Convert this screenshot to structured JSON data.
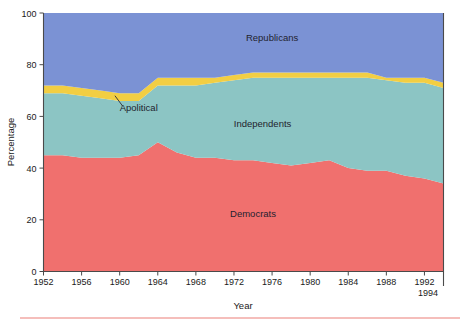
{
  "figure": {
    "background": "#ffffff",
    "bottom_rule_color": "#F2A9A4"
  },
  "axes": {
    "x_title": "Year",
    "y_title": "Percentage",
    "x_tick_labels": [
      "1952",
      "1956",
      "1960",
      "1964",
      "1968",
      "1972",
      "1976",
      "1980",
      "1984",
      "1988",
      "1992"
    ],
    "x_end_label": "1994",
    "y_tick_labels": [
      "0",
      "20",
      "40",
      "60",
      "80",
      "100"
    ]
  },
  "series_labels": {
    "republicans": "Republicans",
    "apolitical": "Apolitical",
    "independents": "Independents",
    "democrats": "Democrats"
  },
  "colors": {
    "democrats": "#F0706E",
    "independents": "#8CC5C4",
    "apolitical": "#F2CE43",
    "republicans": "#7B92D4",
    "axis": "#4a4a4a",
    "text": "#1a1a1a"
  },
  "chart_data": {
    "type": "area",
    "title": "",
    "xlabel": "Year",
    "ylabel": "Percentage",
    "xlim": [
      1952,
      1994
    ],
    "ylim": [
      0,
      100
    ],
    "grid": false,
    "stacked": true,
    "legend": "inline-labels",
    "x": [
      1952,
      1954,
      1956,
      1958,
      1960,
      1962,
      1964,
      1966,
      1968,
      1970,
      1972,
      1974,
      1976,
      1978,
      1980,
      1982,
      1984,
      1986,
      1988,
      1990,
      1992,
      1994
    ],
    "series": [
      {
        "name": "Democrats",
        "color": "#F0706E",
        "values": [
          45,
          45,
          44,
          44,
          44,
          45,
          50,
          46,
          44,
          44,
          43,
          43,
          42,
          41,
          42,
          43,
          40,
          39,
          39,
          37,
          36,
          34
        ]
      },
      {
        "name": "Independents",
        "color": "#8CC5C4",
        "values": [
          24,
          24,
          24,
          23,
          22,
          21,
          22,
          26,
          28,
          29,
          31,
          32,
          33,
          34,
          33,
          32,
          35,
          36,
          35,
          36,
          37,
          37
        ]
      },
      {
        "name": "Apolitical",
        "color": "#F2CE43",
        "values": [
          3,
          3,
          3,
          3,
          3,
          3,
          3,
          3,
          3,
          2,
          2,
          2,
          2,
          2,
          2,
          2,
          2,
          2,
          1,
          2,
          2,
          2
        ]
      },
      {
        "name": "Republicans",
        "color": "#7B92D4",
        "values": [
          28,
          28,
          29,
          30,
          31,
          31,
          25,
          25,
          25,
          25,
          24,
          23,
          23,
          23,
          23,
          23,
          23,
          23,
          25,
          25,
          25,
          27
        ]
      }
    ],
    "annotations": [
      {
        "text": "Republicans",
        "x": 1976,
        "y": 89
      },
      {
        "text": "Independents",
        "x": 1975,
        "y": 56
      },
      {
        "text": "Apolitical",
        "x": 1962,
        "y": 62,
        "leader_to": {
          "x": 1959.5,
          "y": 68
        }
      },
      {
        "text": "Democrats",
        "x": 1974,
        "y": 21
      }
    ]
  }
}
